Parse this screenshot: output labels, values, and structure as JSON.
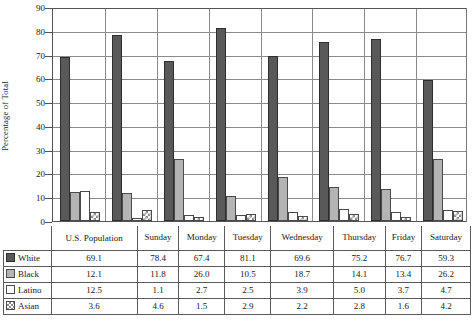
{
  "chart_data": {
    "type": "bar",
    "title": "",
    "xlabel": "",
    "ylabel": "Percentage of Total",
    "ylim": [
      0,
      90
    ],
    "ytick_step": 10,
    "yticks": [
      0,
      10,
      20,
      30,
      40,
      50,
      60,
      70,
      80,
      90
    ],
    "grid": true,
    "legend_position": "table-row-headers",
    "categories": [
      "U.S. Population",
      "Sunday",
      "Monday",
      "Tuesday",
      "Wednesday",
      "Thursday",
      "Friday",
      "Saturday"
    ],
    "series": [
      {
        "name": "White",
        "values": [
          69.1,
          78.4,
          67.4,
          81.1,
          69.6,
          75.2,
          76.7,
          59.3
        ],
        "color": "#595959",
        "pattern": "solid-dark-gray"
      },
      {
        "name": "Black",
        "values": [
          12.1,
          11.8,
          26.0,
          10.5,
          18.7,
          14.1,
          13.4,
          26.2
        ],
        "color": "#b4b4b4",
        "pattern": "solid-light-gray"
      },
      {
        "name": "Latino",
        "values": [
          12.5,
          1.1,
          2.7,
          2.5,
          3.9,
          5.0,
          3.7,
          4.7
        ],
        "color": "#ffffff",
        "pattern": "empty-outline"
      },
      {
        "name": "Asian",
        "values": [
          3.6,
          4.6,
          1.5,
          2.9,
          2.2,
          2.8,
          1.6,
          4.2
        ],
        "color": "#8c8c8c",
        "pattern": "cross-hatch"
      }
    ]
  },
  "table": {
    "corner_label": "",
    "headers": [
      "U.S. Population",
      "Sunday",
      "Monday",
      "Tuesday",
      "Wednesday",
      "Thursday",
      "Friday",
      "Saturday"
    ],
    "rows": [
      {
        "label": "White",
        "values": [
          "69.1",
          "78.4",
          "67.4",
          "81.1",
          "69.6",
          "75.2",
          "76.7",
          "59.3"
        ]
      },
      {
        "label": "Black",
        "values": [
          "12.1",
          "11.8",
          "26.0",
          "10.5",
          "18.7",
          "14.1",
          "13.4",
          "26.2"
        ]
      },
      {
        "label": "Latino",
        "values": [
          "12.5",
          "1.1",
          "2.7",
          "2.5",
          "3.9",
          "5.0",
          "3.7",
          "4.7"
        ]
      },
      {
        "label": "Asian",
        "values": [
          "3.6",
          "4.6",
          "1.5",
          "2.9",
          "2.2",
          "2.8",
          "1.6",
          "4.2"
        ]
      }
    ]
  }
}
